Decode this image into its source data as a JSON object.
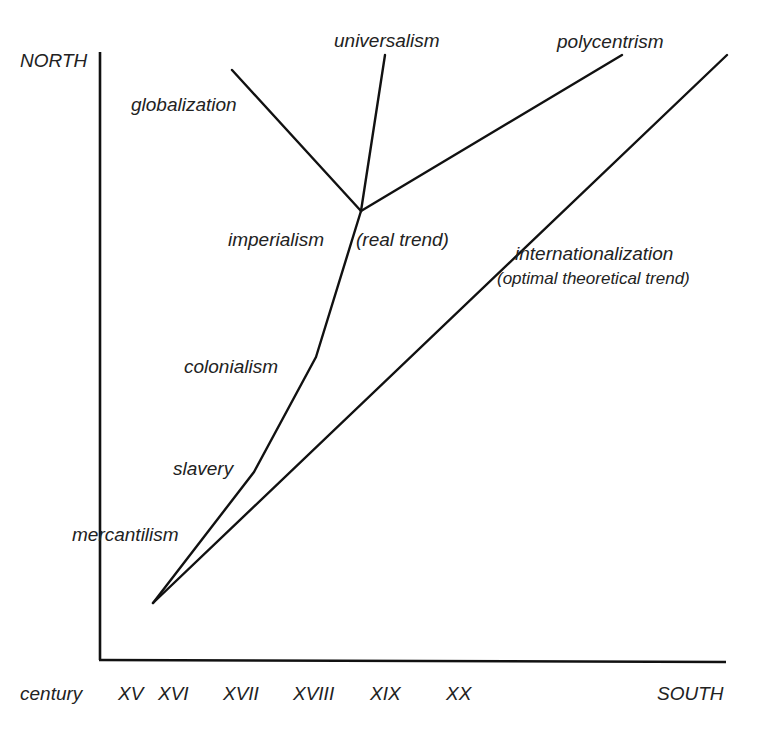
{
  "axes": {
    "y_label": "NORTH",
    "x_label": "SOUTH",
    "x_prefix": "century",
    "x_ticks": [
      "XV",
      "XVI",
      "XVII",
      "XVIII",
      "XIX",
      "XX"
    ]
  },
  "labels": {
    "universalism": "universalism",
    "polycentrism": "polycentrism",
    "globalization": "globalization",
    "imperialism": "imperialism",
    "real_trend": "(real trend)",
    "internationalization": "internationalization",
    "optimal_trend": "(optimal theoretical trend)",
    "colonialism": "colonialism",
    "slavery": "slavery",
    "mercantilism": "mercantilism"
  },
  "colors": {
    "line": "#111111",
    "text": "#222222",
    "background": "#ffffff"
  }
}
